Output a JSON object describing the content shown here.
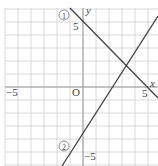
{
  "chart_data": {
    "type": "line",
    "title": "",
    "xlabel": "x",
    "ylabel": "y",
    "origin_label": "O",
    "xlim": [
      -6.2,
      5.8
    ],
    "ylim": [
      -6.1,
      6.1
    ],
    "grid": true,
    "tick_labels": {
      "x": [
        {
          "value": -5,
          "label": "−5"
        },
        {
          "value": 5,
          "label": "5"
        }
      ],
      "y": [
        {
          "value": 5,
          "label": "5"
        },
        {
          "value": -5,
          "label": "−5"
        }
      ]
    },
    "series": [
      {
        "name": "①",
        "label": "①",
        "equation": "y = -x + 5",
        "points": [
          [
            -1,
            6
          ],
          [
            5.8,
            -0.8
          ]
        ]
      },
      {
        "name": "②",
        "label": "②",
        "equation": "y = 1.5x - 3.2",
        "points": [
          [
            -1.6,
            -6.1
          ],
          [
            5.8,
            5.5
          ]
        ]
      }
    ]
  },
  "colors": {
    "grid": "#d0d0d0",
    "axis": "#999999",
    "line": "#444444",
    "text": "#444444"
  }
}
